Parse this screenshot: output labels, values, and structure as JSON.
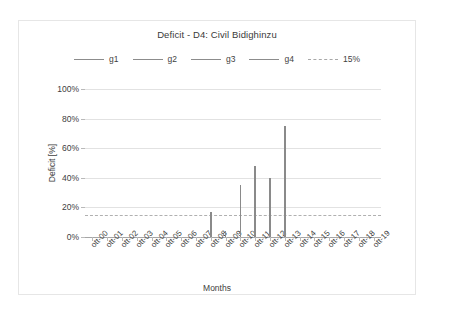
{
  "chart_data": {
    "type": "line",
    "title": "Deficit - D4: Civil Bidighinzu",
    "xlabel": "Months",
    "ylabel": "Deficit [%]",
    "ylim": [
      0,
      100
    ],
    "ytick_labels": [
      "0%",
      "20%",
      "40%",
      "60%",
      "80%",
      "100%"
    ],
    "ytick_values": [
      0,
      20,
      40,
      60,
      80,
      100
    ],
    "grid": true,
    "legend_position": "top-center",
    "categories": [
      "ott-00",
      "ott-01",
      "ott-02",
      "ott-03",
      "ott-04",
      "ott-05",
      "ott-06",
      "ott-07",
      "ott-08",
      "ott-09",
      "ott-10",
      "ott-11",
      "ott-12",
      "ott-13",
      "ott-14",
      "ott-15",
      "ott-16",
      "ott-17",
      "ott-18",
      "ott-19"
    ],
    "series": [
      {
        "name": "g1",
        "color": "#8a8a8a",
        "values": [
          0,
          0,
          0,
          0,
          0,
          0,
          0,
          0,
          17,
          0,
          0,
          0,
          0,
          0,
          0,
          0,
          0,
          0,
          0,
          0
        ]
      },
      {
        "name": "g2",
        "color": "#8a8a8a",
        "values": [
          0,
          0,
          0,
          0,
          0,
          0,
          0,
          0,
          0,
          4,
          35,
          0,
          0,
          0,
          0,
          0,
          0,
          0,
          0,
          0
        ]
      },
      {
        "name": "g3",
        "color": "#8a8a8a",
        "values": [
          0,
          0,
          0,
          0,
          0,
          0,
          0,
          0,
          0,
          0,
          0,
          48,
          40,
          0,
          0,
          0,
          0,
          0,
          0,
          0
        ]
      },
      {
        "name": "g4",
        "color": "#8a8a8a",
        "values": [
          0,
          0,
          0,
          0,
          0,
          0,
          0,
          0,
          0,
          0,
          0,
          0,
          0,
          75,
          0,
          0,
          0,
          0,
          0,
          0
        ]
      }
    ],
    "threshold": {
      "label": "15%",
      "value": 15,
      "style": "dashed",
      "color": "#b0b0b0"
    },
    "spikes": [
      {
        "x_index": 8,
        "value": 17
      },
      {
        "x_index": 9,
        "value": 4
      },
      {
        "x_index": 10,
        "value": 35
      },
      {
        "x_index": 11,
        "value": 48
      },
      {
        "x_index": 12,
        "value": 40
      },
      {
        "x_index": 13,
        "value": 75
      }
    ],
    "legend_entries": [
      {
        "label": "g1",
        "style": "solid"
      },
      {
        "label": "g2",
        "style": "solid"
      },
      {
        "label": "g3",
        "style": "solid"
      },
      {
        "label": "g4",
        "style": "solid"
      },
      {
        "label": "15%",
        "style": "dashed"
      }
    ]
  }
}
